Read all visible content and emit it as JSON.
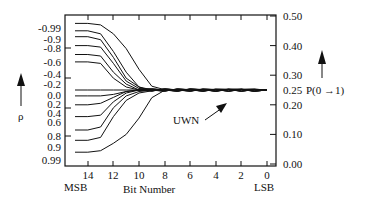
{
  "chart_data": {
    "type": "line",
    "title": "",
    "xlabel": "Bit Number",
    "x_left_label": "MSB",
    "x_right_label": "LSB",
    "ylabel_left": "ρ",
    "ylabel_right": "P(0 →1)",
    "annotation": "UWN",
    "x_ticks": [
      "14",
      "12",
      "10",
      "8",
      "6",
      "4",
      "2",
      "0"
    ],
    "x_range": [
      15,
      0
    ],
    "left_tick_labels": [
      "-0.99",
      "-0.9",
      "-0.8",
      "-0.6",
      "-0.4",
      "-0.2",
      "0.0",
      "0.2",
      "0.4",
      "0.6",
      "0.8",
      "0.9",
      "0.99"
    ],
    "right_tick_labels": [
      "0.50",
      "0.40",
      "0.30",
      "0.25",
      "0.20",
      "0.10",
      "0.00"
    ],
    "ylim": [
      0.0,
      0.5
    ],
    "grid": false,
    "x": [
      15,
      14,
      13,
      12,
      11,
      10,
      9,
      8,
      7,
      6,
      5,
      4,
      3,
      2,
      1,
      0
    ],
    "series": [
      {
        "name": "-0.99",
        "values": [
          0.475,
          0.475,
          0.47,
          0.44,
          0.39,
          0.32,
          0.26,
          0.25,
          0.25,
          0.25,
          0.25,
          0.25,
          0.25,
          0.25,
          0.25,
          0.25
        ]
      },
      {
        "name": "-0.9",
        "values": [
          0.45,
          0.45,
          0.44,
          0.38,
          0.31,
          0.26,
          0.25,
          0.25,
          0.25,
          0.25,
          0.25,
          0.25,
          0.25,
          0.25,
          0.25,
          0.25
        ]
      },
      {
        "name": "-0.8",
        "values": [
          0.43,
          0.43,
          0.42,
          0.36,
          0.29,
          0.26,
          0.25,
          0.25,
          0.25,
          0.25,
          0.25,
          0.25,
          0.25,
          0.25,
          0.25,
          0.25
        ]
      },
      {
        "name": "-0.6",
        "values": [
          0.4,
          0.4,
          0.395,
          0.34,
          0.28,
          0.255,
          0.25,
          0.25,
          0.25,
          0.25,
          0.25,
          0.25,
          0.25,
          0.25,
          0.25,
          0.25
        ]
      },
      {
        "name": "-0.4",
        "values": [
          0.37,
          0.37,
          0.365,
          0.31,
          0.27,
          0.25,
          0.25,
          0.25,
          0.25,
          0.25,
          0.25,
          0.25,
          0.25,
          0.25,
          0.25,
          0.25
        ]
      },
      {
        "name": "-0.2",
        "values": [
          0.345,
          0.345,
          0.34,
          0.29,
          0.26,
          0.25,
          0.25,
          0.25,
          0.25,
          0.25,
          0.25,
          0.25,
          0.25,
          0.25,
          0.25,
          0.25
        ]
      },
      {
        "name": "0.0",
        "values": [
          0.25,
          0.25,
          0.25,
          0.25,
          0.25,
          0.25,
          0.25,
          0.25,
          0.25,
          0.25,
          0.25,
          0.25,
          0.25,
          0.25,
          0.25,
          0.25
        ]
      },
      {
        "name": "0.2",
        "values": [
          0.23,
          0.23,
          0.23,
          0.235,
          0.245,
          0.25,
          0.25,
          0.25,
          0.25,
          0.25,
          0.25,
          0.25,
          0.25,
          0.25,
          0.25,
          0.25
        ]
      },
      {
        "name": "0.4",
        "values": [
          0.2,
          0.2,
          0.205,
          0.225,
          0.245,
          0.25,
          0.25,
          0.25,
          0.25,
          0.25,
          0.25,
          0.25,
          0.25,
          0.25,
          0.25,
          0.25
        ]
      },
      {
        "name": "0.6",
        "values": [
          0.16,
          0.16,
          0.165,
          0.21,
          0.24,
          0.25,
          0.25,
          0.25,
          0.25,
          0.25,
          0.25,
          0.25,
          0.25,
          0.25,
          0.25,
          0.25
        ]
      },
      {
        "name": "0.8",
        "values": [
          0.115,
          0.115,
          0.125,
          0.19,
          0.23,
          0.245,
          0.25,
          0.25,
          0.25,
          0.25,
          0.25,
          0.25,
          0.25,
          0.25,
          0.25,
          0.25
        ]
      },
      {
        "name": "0.9",
        "values": [
          0.08,
          0.08,
          0.09,
          0.16,
          0.215,
          0.24,
          0.25,
          0.25,
          0.25,
          0.25,
          0.25,
          0.25,
          0.25,
          0.25,
          0.25,
          0.25
        ]
      },
      {
        "name": "0.99",
        "values": [
          0.04,
          0.04,
          0.045,
          0.07,
          0.1,
          0.155,
          0.22,
          0.25,
          0.25,
          0.25,
          0.25,
          0.25,
          0.25,
          0.25,
          0.25,
          0.25
        ]
      }
    ]
  }
}
